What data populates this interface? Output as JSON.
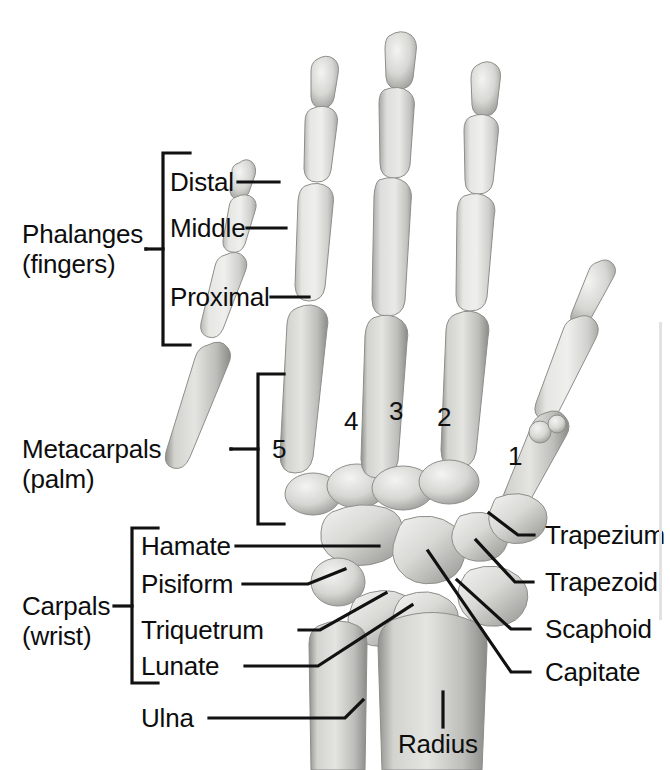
{
  "figure": {
    "background_color": "#ffffff",
    "ink_color": "#0d0d0d",
    "bone_fill": "#dcdcda",
    "bone_shadow": "#9a9a98"
  },
  "group_labels": {
    "phalanges": {
      "line1": "Phalanges",
      "line2": "(fingers)"
    },
    "metacarpals": {
      "line1": "Metacarpals",
      "line2": "(palm)"
    },
    "carpals": {
      "line1": "Carpals",
      "line2": "(wrist)"
    }
  },
  "phalanx_labels": [
    {
      "id": "distal",
      "text": "Distal"
    },
    {
      "id": "middle",
      "text": "Middle"
    },
    {
      "id": "proximal",
      "text": "Proximal"
    }
  ],
  "metacarpal_numbers": [
    {
      "id": "mc5",
      "text": "5"
    },
    {
      "id": "mc4",
      "text": "4"
    },
    {
      "id": "mc3",
      "text": "3"
    },
    {
      "id": "mc2",
      "text": "2"
    },
    {
      "id": "mc1",
      "text": "1"
    }
  ],
  "carpal_labels_left": [
    {
      "id": "hamate",
      "text": "Hamate"
    },
    {
      "id": "pisiform",
      "text": "Pisiform"
    },
    {
      "id": "triquetrum",
      "text": "Triquetrum"
    },
    {
      "id": "lunate",
      "text": "Lunate"
    }
  ],
  "carpal_labels_right": [
    {
      "id": "trapezium",
      "text": "Trapezium"
    },
    {
      "id": "trapezoid",
      "text": "Trapezoid"
    },
    {
      "id": "scaphoid",
      "text": "Scaphoid"
    },
    {
      "id": "capitate",
      "text": "Capitate"
    }
  ],
  "forearm_labels": [
    {
      "id": "ulna",
      "text": "Ulna"
    },
    {
      "id": "radius",
      "text": "Radius"
    }
  ]
}
